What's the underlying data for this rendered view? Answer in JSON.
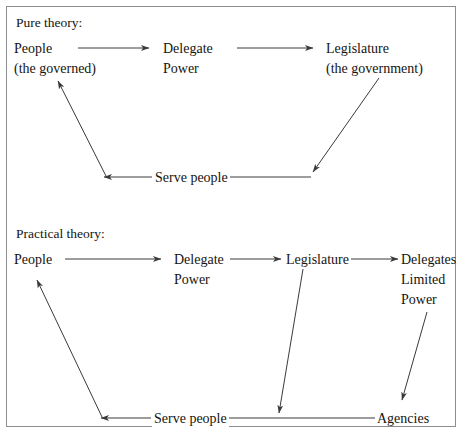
{
  "figure": {
    "type": "flow-diagram",
    "clipped_text_above_frame": "o o",
    "sections": [
      {
        "id": "pure",
        "title": "Pure theory:",
        "nodes": [
          {
            "id": "people",
            "lines": [
              "People",
              "(the governed)"
            ]
          },
          {
            "id": "delegate-power",
            "lines": [
              "Delegate",
              "Power"
            ]
          },
          {
            "id": "legislature",
            "lines": [
              "Legislature",
              "(the government)"
            ]
          }
        ],
        "edges": [
          {
            "from": "people",
            "to": "delegate-power",
            "label": "",
            "style": "straight-arrow"
          },
          {
            "from": "delegate-power",
            "to": "legislature",
            "label": "",
            "style": "straight-arrow"
          },
          {
            "from": "legislature",
            "to": "people",
            "label": "Serve people",
            "style": "return-path"
          }
        ]
      },
      {
        "id": "practical",
        "title": "Practical theory:",
        "nodes": [
          {
            "id": "people2",
            "lines": [
              "People"
            ]
          },
          {
            "id": "delegate-power2",
            "lines": [
              "Delegate",
              "Power"
            ]
          },
          {
            "id": "legislature2",
            "lines": [
              "Legislature"
            ]
          },
          {
            "id": "delegates-limited-power",
            "lines": [
              "Delegates",
              "Limited",
              "Power"
            ]
          },
          {
            "id": "agencies",
            "lines": [
              "Agencies"
            ]
          }
        ],
        "edges": [
          {
            "from": "people2",
            "to": "delegate-power2",
            "label": "",
            "style": "straight-arrow"
          },
          {
            "from": "delegate-power2",
            "to": "legislature2",
            "label": "",
            "style": "straight-arrow"
          },
          {
            "from": "legislature2",
            "to": "delegates-limited-power",
            "label": "",
            "style": "straight-arrow"
          },
          {
            "from": "delegates-limited-power",
            "to": "agencies",
            "label": "",
            "style": "diagonal-arrow"
          },
          {
            "from": "legislature2",
            "to": "serve-line",
            "label": "",
            "style": "diagonal-arrow"
          },
          {
            "from": "agencies",
            "to": "people2",
            "label": "Serve people",
            "style": "return-path"
          }
        ]
      }
    ],
    "labels": {
      "pure_title": "Pure theory:",
      "pure_people_l1": "People",
      "pure_people_l2": "(the governed)",
      "pure_delegate_l1": "Delegate",
      "pure_delegate_l2": "Power",
      "pure_legislature_l1": "Legislature",
      "pure_legislature_l2": "(the government)",
      "pure_serve": "Serve people",
      "practical_title": "Practical theory:",
      "practical_people": "People",
      "practical_delegate_l1": "Delegate",
      "practical_delegate_l2": "Power",
      "practical_legislature": "Legislature",
      "practical_delegates_l1": "Delegates",
      "practical_delegates_l2": "Limited",
      "practical_delegates_l3": "Power",
      "practical_agencies": "Agencies",
      "practical_serve": "Serve people"
    },
    "colors": {
      "ink": "#16140f",
      "line": "#3a3a3a",
      "frame": "#8d8d8d",
      "background": "#ffffff"
    }
  }
}
